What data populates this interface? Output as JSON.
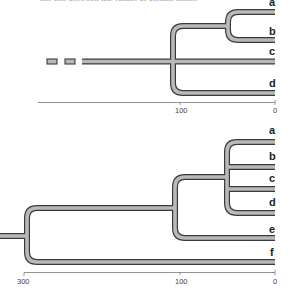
{
  "caption": "her ties between the values of certain items.",
  "tree_top": {
    "leaves": [
      {
        "label": "a"
      },
      {
        "label": "b"
      },
      {
        "label": "c"
      },
      {
        "label": "d"
      }
    ],
    "axis": {
      "ticks": [
        {
          "label": "100"
        },
        {
          "label": "0"
        }
      ]
    }
  },
  "tree_bottom": {
    "leaves": [
      {
        "label": "a"
      },
      {
        "label": "b"
      },
      {
        "label": "c"
      },
      {
        "label": "d"
      },
      {
        "label": "e"
      },
      {
        "label": "f"
      }
    ],
    "axis": {
      "ticks": [
        {
          "label": "300"
        },
        {
          "label": "100"
        },
        {
          "label": "0"
        }
      ]
    }
  },
  "colors": {
    "branch_fill": "#b9b9b9",
    "branch_outline": "#3a3a3a",
    "axis": "#777777",
    "label": "#222222"
  }
}
